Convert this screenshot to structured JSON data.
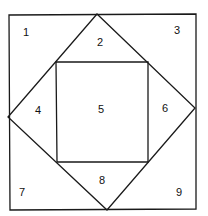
{
  "diagram": {
    "outer_square": {
      "points": [
        [
          9,
          15
        ],
        [
          196,
          14
        ],
        [
          196,
          209
        ],
        [
          10,
          210
        ]
      ]
    },
    "diamond": {
      "points": [
        [
          97,
          14
        ],
        [
          195,
          108
        ],
        [
          107,
          210
        ],
        [
          8,
          117
        ]
      ]
    },
    "inner_square": {
      "points": [
        [
          56,
          62
        ],
        [
          148,
          62
        ],
        [
          148,
          162
        ],
        [
          57,
          162
        ]
      ]
    },
    "regions": [
      {
        "id": "1",
        "label": "1",
        "x": 26,
        "y": 33
      },
      {
        "id": "2",
        "label": "2",
        "x": 100,
        "y": 43
      },
      {
        "id": "3",
        "label": "3",
        "x": 177,
        "y": 31
      },
      {
        "id": "4",
        "label": "4",
        "x": 38,
        "y": 111
      },
      {
        "id": "5",
        "label": "5",
        "x": 101,
        "y": 110
      },
      {
        "id": "6",
        "label": "6",
        "x": 165,
        "y": 109
      },
      {
        "id": "7",
        "label": "7",
        "x": 22,
        "y": 193
      },
      {
        "id": "8",
        "label": "8",
        "x": 102,
        "y": 181
      },
      {
        "id": "9",
        "label": "9",
        "x": 179,
        "y": 193
      }
    ],
    "colors": {
      "stroke": "#1a1a1a",
      "background": "#ffffff",
      "text": "#111111"
    }
  }
}
